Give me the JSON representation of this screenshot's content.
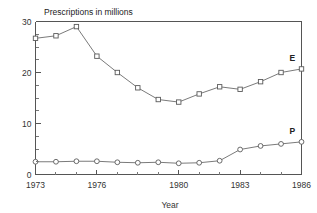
{
  "chart_data": {
    "type": "line",
    "title": "Prescriptions in millions",
    "xlabel": "Year",
    "ylabel": "",
    "x": [
      1973,
      1974,
      1975,
      1976,
      1977,
      1978,
      1979,
      1980,
      1981,
      1982,
      1983,
      1984,
      1985,
      1986
    ],
    "xlim": [
      1973,
      1986
    ],
    "ylim": [
      0,
      30
    ],
    "xticks": [
      1973,
      1976,
      1980,
      1983,
      1986
    ],
    "xtick_labels": [
      "1973",
      "1976",
      "1980",
      "1983",
      "1986"
    ],
    "yticks": [
      0,
      10,
      20,
      30
    ],
    "ytick_labels": [
      "0",
      "10",
      "20",
      "30"
    ],
    "yticks_minor": [
      2.5,
      5,
      7.5,
      12.5,
      15,
      17.5,
      22.5,
      25,
      27.5
    ],
    "grid": false,
    "legend_position": "inline-right",
    "series": [
      {
        "name": "E",
        "label": "E",
        "marker": "square",
        "values": [
          26.7,
          27.2,
          29.0,
          23.2,
          20.0,
          17.0,
          14.7,
          14.2,
          15.8,
          17.2,
          16.7,
          18.2,
          20.0,
          20.7
        ]
      },
      {
        "name": "P",
        "label": "P",
        "marker": "circle",
        "values": [
          2.5,
          2.5,
          2.6,
          2.6,
          2.4,
          2.3,
          2.4,
          2.2,
          2.3,
          2.7,
          4.9,
          5.6,
          6.0,
          6.4
        ]
      }
    ]
  },
  "colors": {
    "line": "#6b6b6b",
    "axis": "#555555",
    "text": "#333333",
    "background": "#ffffff"
  }
}
